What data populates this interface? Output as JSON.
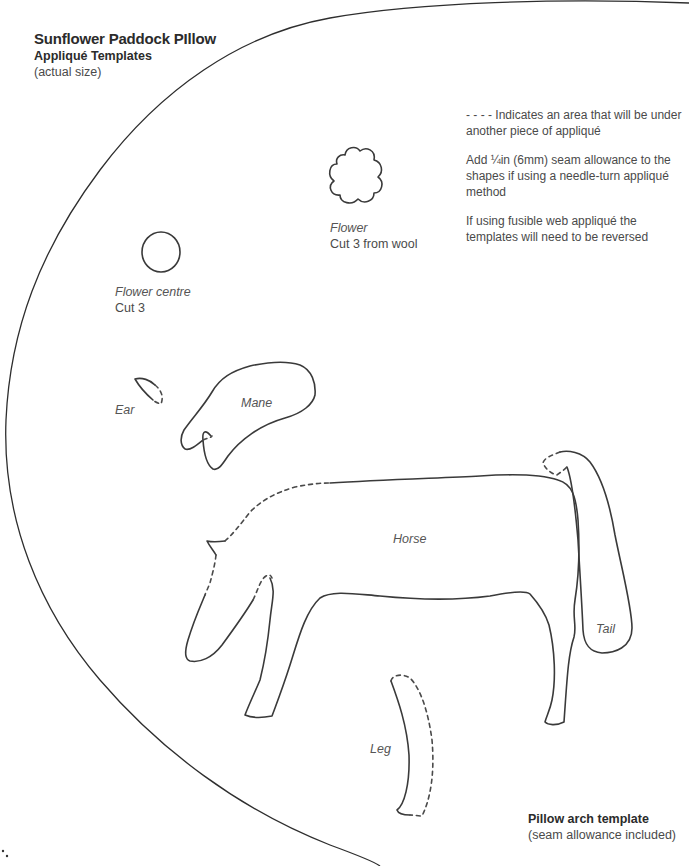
{
  "header": {
    "title": "Sunflower Paddock PIllow",
    "subtitle": "Appliqué Templates",
    "note": "(actual size)"
  },
  "instructions": [
    "- - - - Indicates an area that will be under another piece of appliqué",
    "Add ¼in (6mm) seam allowance to the shapes if using a needle-turn appliqué method",
    "If using fusible web appliqué the templates will need to be reversed"
  ],
  "templates": {
    "flower": {
      "name": "Flower",
      "instruction": "Cut 3 from wool"
    },
    "flower_centre": {
      "name": "Flower centre",
      "instruction": "Cut 3"
    },
    "ear": {
      "name": "Ear"
    },
    "mane": {
      "name": "Mane"
    },
    "horse": {
      "name": "Horse"
    },
    "tail": {
      "name": "Tail"
    },
    "leg": {
      "name": "Leg"
    }
  },
  "footer": {
    "title": "Pillow arch template",
    "note": "(seam allowance included)"
  },
  "colors": {
    "line": "#3a3a3a",
    "text": "#4a4a4a",
    "background": "#ffffff"
  }
}
